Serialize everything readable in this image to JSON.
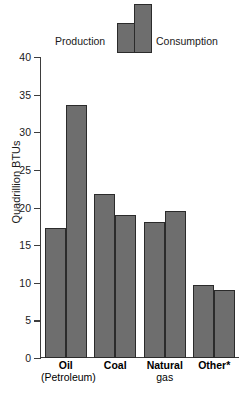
{
  "chart_data": {
    "type": "bar",
    "title": "",
    "subtitle": "",
    "xlabel": "",
    "ylabel": "Quadrillion BTUs",
    "ylim": [
      0,
      40
    ],
    "yticks": [
      0,
      5,
      10,
      15,
      20,
      25,
      30,
      35,
      40
    ],
    "ytick_labels": [
      "0",
      "5",
      "10",
      "15",
      "20",
      "25",
      "30",
      "35",
      "40"
    ],
    "grid": false,
    "legend_position": "top",
    "categories": [
      "Oil\n(Petroleum)",
      "Coal",
      "Natural gas",
      "Other*"
    ],
    "category_labels": [
      {
        "line1": "Oil",
        "line2": "(Petroleum)"
      },
      {
        "line1": "Coal",
        "line2": ""
      },
      {
        "line1": "Natural",
        "line2": "gas"
      },
      {
        "line1": "Other*",
        "line2": ""
      }
    ],
    "series": [
      {
        "name": "Production",
        "values": [
          17.3,
          21.8,
          18.1,
          9.7
        ]
      },
      {
        "name": "Consumption",
        "values": [
          33.6,
          19.0,
          19.6,
          9.1
        ]
      }
    ],
    "legend": [
      "Production",
      "Consumption"
    ],
    "colors": {
      "bar_fill": "#6e6e6e",
      "bar_stroke": "#2b2b2b",
      "axis": "#3d3d3d",
      "text": "#1a1a1a",
      "background": "#ffffff"
    }
  },
  "legend": {
    "production_label": "Production",
    "consumption_label": "Consumption"
  },
  "axis": {
    "y_title": "Quadrillion BTUs"
  }
}
